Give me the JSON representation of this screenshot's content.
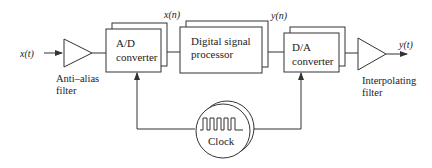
{
  "diagram": {
    "type": "block-diagram",
    "title": "",
    "colors": {
      "stroke": "#333333",
      "text": "#222222",
      "background": "#ffffff"
    },
    "signals": {
      "input": "x(t)",
      "sampled": "x(n)",
      "processed": "y(n)",
      "output": "y(t)"
    },
    "blocks": {
      "anti_alias": {
        "shape": "triangle",
        "caption_line1": "Anti–alias",
        "caption_line2": "filter"
      },
      "ad": {
        "shape": "box",
        "line1": "A/D",
        "line2": "converter"
      },
      "dsp": {
        "shape": "box",
        "line1": "Digital signal",
        "line2": "processor"
      },
      "da": {
        "shape": "box",
        "line1": "D/A",
        "line2": "converter"
      },
      "interp": {
        "shape": "triangle",
        "caption_line1": "Interpolating",
        "caption_line2": "filter"
      },
      "clock": {
        "shape": "circle",
        "label": "Clock",
        "icon": "square-wave-icon"
      }
    },
    "edges": [
      {
        "from": "input",
        "to": "anti_alias",
        "label": "x(t)"
      },
      {
        "from": "anti_alias",
        "to": "ad"
      },
      {
        "from": "ad",
        "to": "dsp",
        "label": "x(n)"
      },
      {
        "from": "dsp",
        "to": "da",
        "label": "y(n)"
      },
      {
        "from": "da",
        "to": "interp"
      },
      {
        "from": "interp",
        "to": "output",
        "label": "y(t)"
      },
      {
        "from": "clock",
        "to": "ad"
      },
      {
        "from": "clock",
        "to": "da"
      }
    ]
  }
}
